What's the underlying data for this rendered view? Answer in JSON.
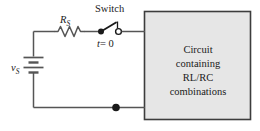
{
  "figure": {
    "colors": {
      "wire": "#555555",
      "ink": "#1a1a1a",
      "box_fill": "#e6e6e6",
      "box_border": "#3d3d3d",
      "page_background": "#ffffff"
    }
  },
  "labels": {
    "switch": "Switch",
    "switch_time": "t = 0",
    "switch_time_variable": "t",
    "switch_time_value": "= 0",
    "resistor": "R",
    "resistor_subscript": "S",
    "source": "v",
    "source_subscript": "S"
  },
  "block": {
    "lines": [
      "Circuit",
      "containing",
      "RL/RC",
      "combinations"
    ]
  },
  "components": [
    {
      "name": "voltage-source",
      "type": "battery",
      "label": "vS"
    },
    {
      "name": "series-resistor",
      "type": "resistor",
      "label": "RS"
    },
    {
      "name": "switch",
      "type": "spst-switch",
      "state": "open",
      "label": "t = 0"
    },
    {
      "name": "circuit-block",
      "type": "black-box",
      "label": "Circuit containing RL/RC combinations"
    }
  ],
  "nodes": [
    {
      "name": "switch-left-terminal",
      "style": "filled"
    },
    {
      "name": "switch-right-terminal",
      "style": "open"
    },
    {
      "name": "bottom-junction",
      "style": "filled"
    }
  ]
}
